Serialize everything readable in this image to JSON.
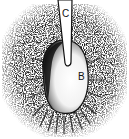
{
  "figure": {
    "labels": [
      {
        "id": "C",
        "text": "C",
        "target": "shaft"
      },
      {
        "id": "B",
        "text": "B",
        "target": "bulb"
      }
    ],
    "colors": {
      "background": "#ffffff",
      "ink": "#111111",
      "stipple": "#8a8a8a"
    }
  }
}
